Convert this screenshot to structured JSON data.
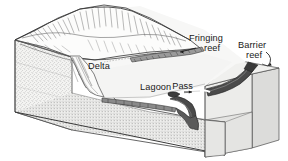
{
  "figure": {
    "type": "geological-block-diagram",
    "background_color": "#ffffff",
    "width": 288,
    "height": 161
  },
  "labels": {
    "fringing_reef_line1": "Fringing",
    "fringing_reef_line2": "reef",
    "barrier_reef_line1": "Barrier",
    "barrier_reef_line2": "reef",
    "delta": "Delta",
    "lagoon": "Lagoon",
    "pass": "Pass"
  },
  "colors": {
    "ink": "#1a1a1a",
    "line": "#3a3a3a",
    "reef_dark": "#4a4a4a",
    "reef_darker": "#2e2e2e",
    "block_top": "#f2f2f0",
    "block_front": "#e2e2e0",
    "block_side": "#d5d5d3",
    "lagoon_fill": "#f6f6f5",
    "mountain_fill": "#fafafa",
    "stipple": "#8a8a8a",
    "background": "#ffffff"
  },
  "features": [
    {
      "name": "mountain-island",
      "description": "Hachured volcanic mountain mass occupying upper-left of the block"
    },
    {
      "name": "delta",
      "description": "Fan-shaped sediment delta at the foot of the mountain meeting the lagoon"
    },
    {
      "name": "lagoon",
      "description": "Shallow water body between the shoreline and the barrier reef"
    },
    {
      "name": "fringing-reef",
      "description": "Narrow reef band attached to the island shoreline"
    },
    {
      "name": "barrier-reef",
      "description": "Dark thick reef band separated from shore, along the outer edge"
    },
    {
      "name": "pass",
      "description": "Gap or channel cutting through the barrier reef"
    },
    {
      "name": "block-cut-faces",
      "description": "Stippled cross-section faces of the cut-away earth block"
    }
  ]
}
